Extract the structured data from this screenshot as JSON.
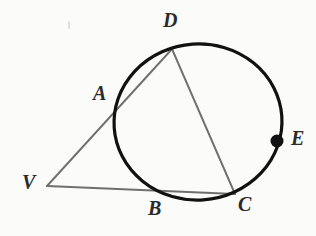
{
  "figure": {
    "background_color": "#fbfbfa",
    "width": 316,
    "height": 236
  },
  "style": {
    "circle_color": "#111111",
    "circle_stroke_width": 3.2,
    "chord_color": "#6f6f6f",
    "chord_stroke_width": 1.9,
    "label_color": "#2b2b2b",
    "marker_color": "#111111"
  },
  "circle": {
    "name": "main-circle",
    "center_x": 198,
    "center_y": 122,
    "radius_x": 84,
    "radius_y": 78,
    "rotation_deg": -4
  },
  "points": [
    {
      "id": "V",
      "label": "V",
      "x": 47,
      "y": 186,
      "label_x": 22,
      "label_y": 172,
      "marked": false,
      "on_circle": false
    },
    {
      "id": "A",
      "label": "A",
      "x": 121,
      "y": 102,
      "label_x": 93,
      "label_y": 83,
      "marked": false,
      "on_circle": true
    },
    {
      "id": "D",
      "label": "D",
      "x": 172,
      "y": 49,
      "label_x": 163,
      "label_y": 10,
      "marked": false,
      "on_circle": true
    },
    {
      "id": "B",
      "label": "B",
      "x": 156,
      "y": 191,
      "label_x": 148,
      "label_y": 198,
      "marked": false,
      "on_circle": true
    },
    {
      "id": "C",
      "label": "C",
      "x": 235,
      "y": 194,
      "label_x": 238,
      "label_y": 194,
      "marked": false,
      "on_circle": true
    },
    {
      "id": "E",
      "label": "E",
      "x": 277,
      "y": 141,
      "label_x": 291,
      "label_y": 128,
      "marked": true,
      "on_circle": true
    }
  ],
  "segments": [
    {
      "id": "VD",
      "from": "V",
      "to": "D",
      "through": "A",
      "kind": "secant"
    },
    {
      "id": "VC",
      "from": "V",
      "to": "C",
      "through": "B",
      "kind": "secant"
    },
    {
      "id": "DC",
      "from": "D",
      "to": "C",
      "through": "",
      "kind": "chord"
    }
  ],
  "marker": {
    "name": "point-e-marker",
    "x": 277,
    "y": 141,
    "radius": 6.5
  },
  "artifacts": [
    {
      "id": "tick-mark",
      "x": 68,
      "y": 21,
      "width": 2,
      "height": 8
    }
  ]
}
